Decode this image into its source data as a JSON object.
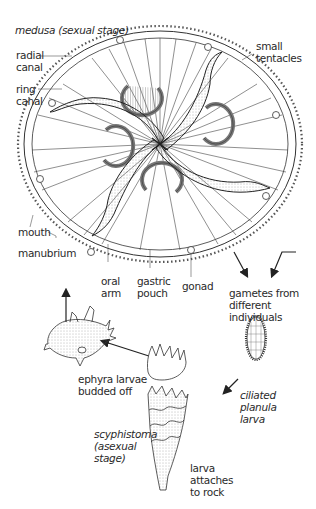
{
  "diagram": {
    "labels": {
      "medusa": "medusa (sexual stage)",
      "radial_canal_1": "radial",
      "radial_canal_2": "canal",
      "ring_canal_1": "ring",
      "ring_canal_2": "canal",
      "small_tentacles_1": "small",
      "small_tentacles_2": "tentacles",
      "mouth": "mouth",
      "manubrium": "manubrium",
      "oral_arm_1": "oral",
      "oral_arm_2": "arm",
      "gastric_pouch_1": "gastric",
      "gastric_pouch_2": "pouch",
      "gonad": "gonad",
      "gametes_1": "gametes from",
      "gametes_2": "different",
      "gametes_3": "individuals",
      "planula_1": "ciliated",
      "planula_2": "planula",
      "planula_3": "larva",
      "ephyra_1": "ephyra larvae",
      "ephyra_2": "budded off",
      "scyphistoma_1": "scyphistoma",
      "scyphistoma_2": "(asexual",
      "scyphistoma_3": "stage)",
      "attach_1": "larva",
      "attach_2": "attaches",
      "attach_3": "to rock"
    },
    "stages": [
      "medusa",
      "gametes",
      "ciliated planula larva",
      "scyphistoma",
      "ephyra larvae",
      "young medusa"
    ],
    "colors": {
      "line": "#333333",
      "shade": "#bbbbbb",
      "background": "#ffffff"
    }
  }
}
